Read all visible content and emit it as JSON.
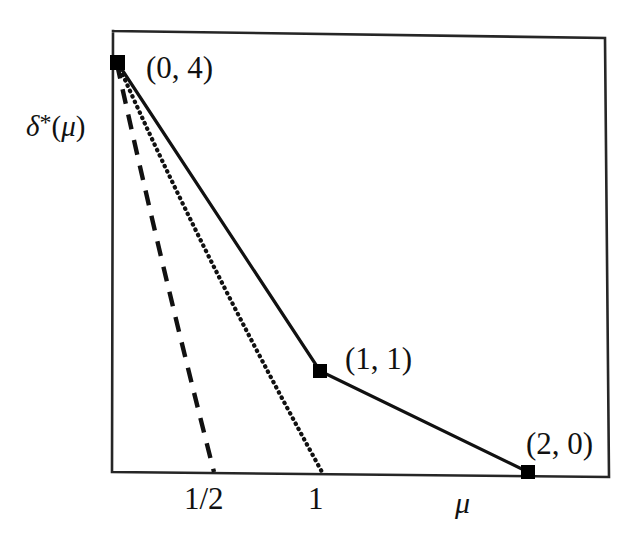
{
  "figure": {
    "y_axis_label": "δ*(μ)",
    "x_axis_label": "μ",
    "point_labels": {
      "p0": "(0, 4)",
      "p1": "(1, 1)",
      "p2": "(2, 0)"
    },
    "tick_labels": {
      "half": "1/2",
      "one": "1"
    }
  },
  "chart_data": {
    "type": "line",
    "title": "",
    "xlabel": "μ",
    "ylabel": "δ*(μ)",
    "xlim": [
      0,
      2.44
    ],
    "ylim": [
      0,
      4.43
    ],
    "grid": false,
    "legend": false,
    "series": [
      {
        "name": "delta-star",
        "style": "solid",
        "marker": "filled-square",
        "points": [
          {
            "x": 0,
            "y": 4,
            "label": "(0, 4)"
          },
          {
            "x": 1,
            "y": 1,
            "label": "(1, 1)"
          },
          {
            "x": 2,
            "y": 0,
            "label": "(2, 0)"
          }
        ]
      },
      {
        "name": "dashed-reference-line",
        "style": "dashed",
        "marker": "none",
        "points": [
          {
            "x": 0,
            "y": 4
          },
          {
            "x": 0.5,
            "y": 0
          }
        ]
      },
      {
        "name": "dotted-reference-line",
        "style": "dotted",
        "marker": "none",
        "points": [
          {
            "x": 0,
            "y": 4
          },
          {
            "x": 1,
            "y": 0
          }
        ]
      }
    ],
    "xticks": [
      0.5,
      1
    ],
    "xticklabels": [
      "1/2",
      "1"
    ],
    "yticks": [],
    "yticklabels": [],
    "annotations": [
      {
        "text": "(0, 4)",
        "x": 0,
        "y": 4
      },
      {
        "text": "(1, 1)",
        "x": 1,
        "y": 1
      },
      {
        "text": "(2, 0)",
        "x": 2,
        "y": 0
      }
    ],
    "colors": {
      "line": "#111111",
      "marker": "#000000",
      "frame": "#333333",
      "background": "#ffffff"
    }
  }
}
